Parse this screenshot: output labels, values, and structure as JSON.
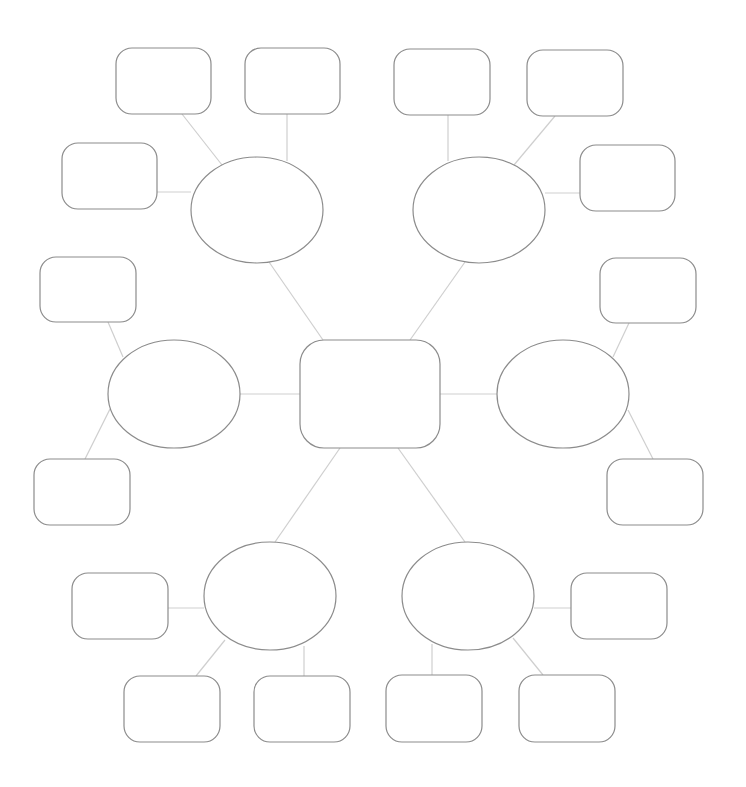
{
  "diagram": {
    "type": "mind-map",
    "title": "",
    "colors": {
      "background": "#ffffff",
      "shape_stroke": "#8c8c8c",
      "connector_stroke": "#cfcfcf"
    },
    "center": {
      "id": "center",
      "shape": "rounded-rect",
      "x": 300,
      "y": 340,
      "w": 140,
      "h": 108,
      "rx": 24,
      "label": ""
    },
    "branches": [
      {
        "id": "b1",
        "shape": "ellipse",
        "cx": 257,
        "cy": 210,
        "rx": 66,
        "ry": 53,
        "label": "",
        "leaves": [
          {
            "id": "b1-l1",
            "x": 116,
            "y": 48,
            "w": 95,
            "h": 66,
            "label": ""
          },
          {
            "id": "b1-l2",
            "x": 245,
            "y": 48,
            "w": 95,
            "h": 66,
            "label": ""
          },
          {
            "id": "b1-l3",
            "x": 62,
            "y": 143,
            "w": 95,
            "h": 66,
            "label": ""
          }
        ]
      },
      {
        "id": "b2",
        "shape": "ellipse",
        "cx": 479,
        "cy": 210,
        "rx": 66,
        "ry": 53,
        "label": "",
        "leaves": [
          {
            "id": "b2-l1",
            "x": 394,
            "y": 49,
            "w": 96,
            "h": 66,
            "label": ""
          },
          {
            "id": "b2-l2",
            "x": 527,
            "y": 50,
            "w": 96,
            "h": 66,
            "label": ""
          },
          {
            "id": "b2-l3",
            "x": 580,
            "y": 145,
            "w": 95,
            "h": 66,
            "label": ""
          }
        ]
      },
      {
        "id": "b3",
        "shape": "ellipse",
        "cx": 174,
        "cy": 394,
        "rx": 66,
        "ry": 54,
        "label": "",
        "leaves": [
          {
            "id": "b3-l1",
            "x": 40,
            "y": 257,
            "w": 96,
            "h": 65,
            "label": ""
          },
          {
            "id": "b3-l2",
            "x": 34,
            "y": 459,
            "w": 96,
            "h": 66,
            "label": ""
          }
        ]
      },
      {
        "id": "b4",
        "shape": "ellipse",
        "cx": 563,
        "cy": 394,
        "rx": 66,
        "ry": 54,
        "label": "",
        "leaves": [
          {
            "id": "b4-l1",
            "x": 600,
            "y": 258,
            "w": 96,
            "h": 65,
            "label": ""
          },
          {
            "id": "b4-l2",
            "x": 607,
            "y": 459,
            "w": 96,
            "h": 66,
            "label": ""
          }
        ]
      },
      {
        "id": "b5",
        "shape": "ellipse",
        "cx": 270,
        "cy": 596,
        "rx": 66,
        "ry": 54,
        "label": "",
        "leaves": [
          {
            "id": "b5-l1",
            "x": 72,
            "y": 573,
            "w": 96,
            "h": 66,
            "label": ""
          },
          {
            "id": "b5-l2",
            "x": 124,
            "y": 676,
            "w": 96,
            "h": 66,
            "label": ""
          },
          {
            "id": "b5-l3",
            "x": 254,
            "y": 676,
            "w": 96,
            "h": 66,
            "label": ""
          }
        ]
      },
      {
        "id": "b6",
        "shape": "ellipse",
        "cx": 468,
        "cy": 596,
        "rx": 66,
        "ry": 54,
        "label": "",
        "leaves": [
          {
            "id": "b6-l1",
            "x": 571,
            "y": 573,
            "w": 96,
            "h": 66,
            "label": ""
          },
          {
            "id": "b6-l2",
            "x": 386,
            "y": 675,
            "w": 96,
            "h": 67,
            "label": ""
          },
          {
            "id": "b6-l3",
            "x": 519,
            "y": 675,
            "w": 96,
            "h": 67,
            "label": ""
          }
        ]
      }
    ],
    "connectors": [
      {
        "from": "center",
        "to": "b1",
        "x1": 323,
        "y1": 340,
        "x2": 269,
        "y2": 262
      },
      {
        "from": "center",
        "to": "b2",
        "x1": 410,
        "y1": 340,
        "x2": 465,
        "y2": 262
      },
      {
        "from": "center",
        "to": "b3",
        "x1": 300,
        "y1": 394,
        "x2": 240,
        "y2": 394
      },
      {
        "from": "center",
        "to": "b4",
        "x1": 440,
        "y1": 394,
        "x2": 497,
        "y2": 394
      },
      {
        "from": "center",
        "to": "b5",
        "x1": 340,
        "y1": 448,
        "x2": 275,
        "y2": 542
      },
      {
        "from": "center",
        "to": "b6",
        "x1": 398,
        "y1": 448,
        "x2": 465,
        "y2": 542
      },
      {
        "from": "b1",
        "to": "b1-l1",
        "x1": 222,
        "y1": 165,
        "x2": 182,
        "y2": 114
      },
      {
        "from": "b1",
        "to": "b1-l2",
        "x1": 287,
        "y1": 161,
        "x2": 287,
        "y2": 114
      },
      {
        "from": "b1",
        "to": "b1-l3",
        "x1": 191,
        "y1": 192,
        "x2": 157,
        "y2": 192
      },
      {
        "from": "b2",
        "to": "b2-l1",
        "x1": 448,
        "y1": 161,
        "x2": 448,
        "y2": 115
      },
      {
        "from": "b2",
        "to": "b2-l2",
        "x1": 514,
        "y1": 165,
        "x2": 555,
        "y2": 116
      },
      {
        "from": "b2",
        "to": "b2-l3",
        "x1": 545,
        "y1": 193,
        "x2": 580,
        "y2": 193
      },
      {
        "from": "b3",
        "to": "b3-l1",
        "x1": 123,
        "y1": 357,
        "x2": 108,
        "y2": 322
      },
      {
        "from": "b3",
        "to": "b3-l2",
        "x1": 110,
        "y1": 409,
        "x2": 85,
        "y2": 459
      },
      {
        "from": "b4",
        "to": "b4-l1",
        "x1": 613,
        "y1": 357,
        "x2": 629,
        "y2": 323
      },
      {
        "from": "b4",
        "to": "b4-l2",
        "x1": 628,
        "y1": 410,
        "x2": 653,
        "y2": 459
      },
      {
        "from": "b5",
        "to": "b5-l1",
        "x1": 204,
        "y1": 608,
        "x2": 168,
        "y2": 608
      },
      {
        "from": "b5",
        "to": "b5-l2",
        "x1": 225,
        "y1": 640,
        "x2": 196,
        "y2": 676
      },
      {
        "from": "b5",
        "to": "b5-l3",
        "x1": 304,
        "y1": 646,
        "x2": 304,
        "y2": 676
      },
      {
        "from": "b6",
        "to": "b6-l1",
        "x1": 534,
        "y1": 608,
        "x2": 571,
        "y2": 608
      },
      {
        "from": "b6",
        "to": "b6-l2",
        "x1": 432,
        "y1": 644,
        "x2": 432,
        "y2": 675
      },
      {
        "from": "b6",
        "to": "b6-l3",
        "x1": 513,
        "y1": 638,
        "x2": 543,
        "y2": 675
      }
    ]
  }
}
